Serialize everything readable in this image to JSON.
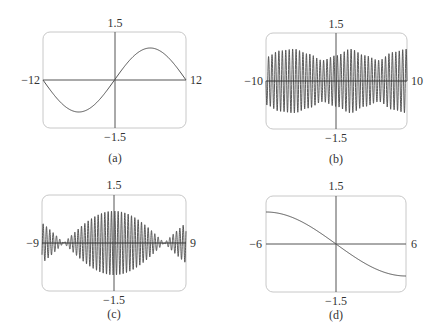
{
  "figure": {
    "panels_count": 4,
    "colors": {
      "frame": "#c8c8c8",
      "axis": "#555555",
      "curve": "#555555",
      "dense": "#4a4a4a"
    }
  },
  "chart_data": [
    {
      "type": "line",
      "panel": "a",
      "caption": "(a)",
      "title": "",
      "xlabel": "",
      "ylabel": "",
      "xlim": [
        -12,
        12
      ],
      "ylim": [
        -1.5,
        1.5
      ],
      "tick_labels": {
        "x_min": "−12",
        "x_max": "12",
        "y_max": "1.5",
        "y_min": "−1.5"
      },
      "grid": false,
      "legend": null,
      "description": "Single slow sine wave, one full period over [-12,12], amplitude 1, passing through origin, minimum near x=-6, maximum near x=6",
      "function": "sin(pi*x/12)",
      "x": [
        -12,
        -9,
        -6,
        -3,
        0,
        3,
        6,
        9,
        12
      ],
      "y": [
        0,
        -0.71,
        -1.0,
        -0.71,
        0,
        0.71,
        1.0,
        0.71,
        0
      ]
    },
    {
      "type": "line",
      "panel": "b",
      "caption": "(b)",
      "title": "",
      "xlabel": "",
      "ylabel": "",
      "xlim": [
        -10,
        10
      ],
      "ylim": [
        -1.5,
        1.5
      ],
      "tick_labels": {
        "x_min": "−10",
        "x_max": "10",
        "y_max": "1.5",
        "y_min": "−1.5"
      },
      "grid": false,
      "legend": null,
      "description": "Rapid oscillation (~2 cycles per unit) with amplitude slowly modulating between about 0.6 and 1.0; amplitude peaks near x=-6, x=1.5, x=8 and dips near x=-2, x=4.5",
      "envelope_x": [
        -10,
        -8,
        -6,
        -4,
        -2,
        0,
        2,
        4,
        6,
        8,
        10
      ],
      "envelope_y": [
        0.75,
        0.95,
        1.0,
        0.85,
        0.65,
        0.8,
        1.0,
        0.8,
        0.65,
        0.9,
        1.0
      ]
    },
    {
      "type": "line",
      "panel": "c",
      "caption": "(c)",
      "title": "",
      "xlabel": "",
      "ylabel": "",
      "xlim": [
        -9,
        9
      ],
      "ylim": [
        -1.5,
        1.5
      ],
      "tick_labels": {
        "x_min": "−9",
        "x_max": "9",
        "y_max": "1.5",
        "y_min": "−1.5"
      },
      "grid": false,
      "legend": null,
      "description": "Beat pattern: rapid oscillation (~2.4 cycles per unit) inside a cosine envelope with max amplitude 1.0 at x=0, nodes near x=±6.3, re-growing to ~0.7 at edges",
      "envelope_function": "|cos(x/4)|",
      "envelope_x": [
        -9,
        -6.3,
        -3,
        0,
        3,
        6.3,
        9
      ],
      "envelope_y": [
        0.65,
        0.0,
        0.73,
        1.0,
        0.73,
        0.0,
        0.65
      ]
    },
    {
      "type": "line",
      "panel": "d",
      "caption": "(d)",
      "title": "",
      "xlabel": "",
      "ylabel": "",
      "xlim": [
        -6,
        6
      ],
      "ylim": [
        -1.5,
        1.5
      ],
      "tick_labels": {
        "x_min": "−6",
        "x_max": "6",
        "y_max": "1.5",
        "y_min": "−1.5"
      },
      "grid": false,
      "legend": null,
      "description": "Smooth decreasing curve from y≈1 at x=-6 through origin to y≈-1 at x=6 (half-period of -sin)",
      "function": "-sin(pi*x/12)",
      "x": [
        -6,
        -4,
        -2,
        0,
        2,
        4,
        6
      ],
      "y": [
        1.0,
        0.87,
        0.5,
        0,
        -0.5,
        -0.87,
        -1.0
      ]
    }
  ]
}
